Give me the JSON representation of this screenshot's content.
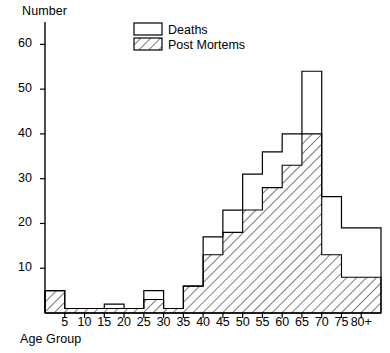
{
  "chart_data": {
    "type": "bar",
    "title": "",
    "subtitle": "",
    "xlabel": "Age Group",
    "ylabel": "Number",
    "grid": false,
    "legend_position": "top-center",
    "ylim": [
      0,
      65
    ],
    "yticks": [
      10,
      20,
      30,
      40,
      50,
      60
    ],
    "xticks": [
      "5",
      "10",
      "15",
      "20",
      "25",
      "30",
      "35",
      "40",
      "45",
      "50",
      "55",
      "60",
      "65",
      "70",
      "75",
      "80+"
    ],
    "categories": [
      "0-5",
      "5-10",
      "10-15",
      "15-20",
      "20-25",
      "25-30",
      "30-35",
      "35-40",
      "40-45",
      "45-50",
      "50-55",
      "55-60",
      "60-65",
      "65-70",
      "70-75",
      "75-80",
      "80+"
    ],
    "series": [
      {
        "name": "Deaths",
        "fill": "none",
        "values": [
          5,
          1,
          1,
          2,
          1,
          5,
          1,
          6,
          17,
          23,
          31,
          36,
          40,
          54,
          26,
          19,
          19
        ]
      },
      {
        "name": "Post Mortems",
        "fill": "hatched",
        "values": [
          5,
          1,
          1,
          1,
          1,
          3,
          1,
          6,
          13,
          18,
          23,
          28,
          33,
          40,
          13,
          8,
          8
        ]
      }
    ]
  },
  "legend": {
    "items": [
      {
        "label": "Deaths",
        "swatch": "open"
      },
      {
        "label": "Post Mortems",
        "swatch": "hatched"
      }
    ]
  },
  "colors": {
    "ink": "#000000",
    "background": "#ffffff"
  }
}
